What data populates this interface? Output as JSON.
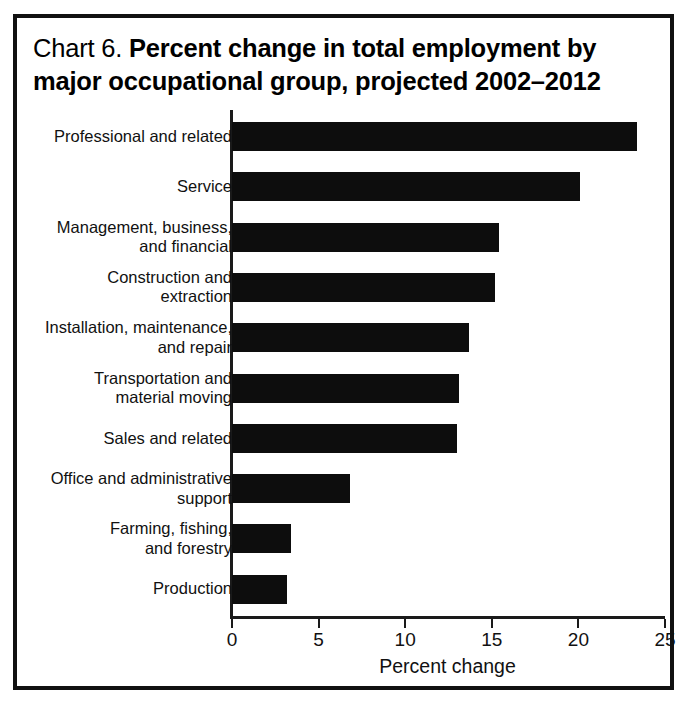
{
  "figure": {
    "title_prefix": "Chart 6.  ",
    "title_main": "Percent change in total employment by major occupational group, projected 2002–2012",
    "border_color": "#111111",
    "bar_color": "#0d0d0d"
  },
  "chart_data": {
    "type": "bar",
    "orientation": "horizontal",
    "title": "Chart 6.  Percent change in total employment by major occupational group, projected 2002–2012",
    "xlabel": "Percent change",
    "ylabel": "",
    "xlim": [
      0,
      25
    ],
    "xticks": [
      0,
      5,
      10,
      15,
      20,
      25
    ],
    "xtick_labels": [
      "0",
      "5",
      "10",
      "15",
      "20",
      "25"
    ],
    "grid": false,
    "legend": null,
    "categories": [
      "Professional and related",
      "Service",
      "Management, business, and financial",
      "Construction and extraction",
      "Installation, maintenance, and repair",
      "Transportation and material moving",
      "Sales and related",
      "Office and administrative support",
      "Farming, fishing, and forestry",
      "Production"
    ],
    "category_lines": [
      [
        "Professional and related"
      ],
      [
        "Service"
      ],
      [
        "Management, business,",
        "and financial"
      ],
      [
        "Construction and",
        "extraction"
      ],
      [
        "Installation, maintenance,",
        "and repair"
      ],
      [
        "Transportation and",
        "material moving"
      ],
      [
        "Sales and related"
      ],
      [
        "Office and administrative",
        "support"
      ],
      [
        "Farming, fishing,",
        "and forestry"
      ],
      [
        "Production"
      ]
    ],
    "values": [
      23.4,
      20.1,
      15.4,
      15.2,
      13.7,
      13.1,
      13.0,
      6.8,
      3.4,
      3.2
    ]
  }
}
